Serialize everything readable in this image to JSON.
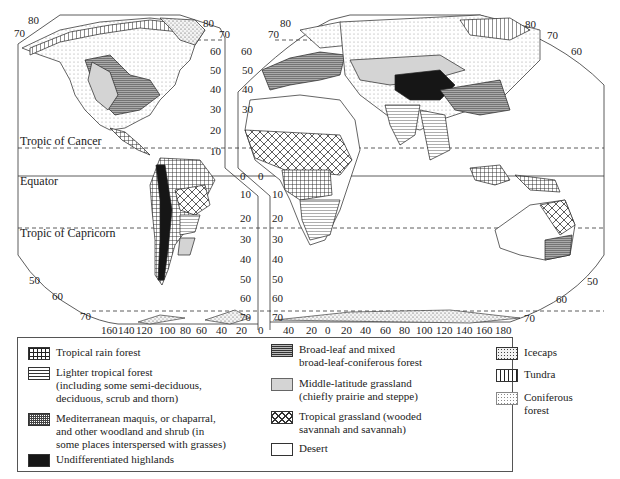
{
  "figure": {
    "type": "world vegetation map",
    "parallels": {
      "tropic_of_cancer": "Tropic of Cancer",
      "equator": "Equator",
      "tropic_of_capricorn": "Tropic of Capricorn"
    },
    "latitude_labels_left_panel_top": [
      "80",
      "70"
    ],
    "latitude_labels_left_panel_right_edge": [
      "80",
      "70",
      "60",
      "50",
      "40",
      "30",
      "20",
      "10",
      "0",
      "10",
      "20",
      "30",
      "40",
      "50",
      "60",
      "70"
    ],
    "latitude_labels_right_panel_left_edge": [
      "80",
      "70",
      "60",
      "50",
      "40",
      "30",
      "0",
      "10",
      "20",
      "30",
      "40",
      "50",
      "60",
      "70"
    ],
    "latitude_labels_left_bottom": [
      "50",
      "60",
      "70"
    ],
    "latitude_labels_right_top": [
      "80",
      "70",
      "60"
    ],
    "latitude_labels_right_bottom": [
      "50",
      "60",
      "70"
    ],
    "longitude_labels_west": [
      "160",
      "140",
      "120",
      "100",
      "80",
      "60",
      "40",
      "20",
      "0"
    ],
    "longitude_labels_east": [
      "40",
      "20",
      "0",
      "20",
      "40",
      "60",
      "80",
      "100",
      "120",
      "140",
      "160",
      "180"
    ]
  },
  "legend": {
    "items": [
      {
        "key": "tropical-rain-forest",
        "lines": [
          "Tropical rain forest"
        ]
      },
      {
        "key": "lighter-tropical-forest",
        "lines": [
          "Lighter tropical forest",
          "(including some semi-deciduous,",
          "deciduous, scrub and thorn)"
        ]
      },
      {
        "key": "mediterranean",
        "lines": [
          "Mediterranean maquis, or chaparral,",
          "and other woodland and shrub (in",
          "some places interspersed with grasses)"
        ]
      },
      {
        "key": "undifferentiated-highlands",
        "lines": [
          "Undifferentiated highlands"
        ]
      },
      {
        "key": "broad-leaf",
        "lines": [
          "Broad-leaf and mixed",
          "broad-leaf-coniferous forest"
        ]
      },
      {
        "key": "middle-latitude-grassland",
        "lines": [
          "Middle-latitude grassland",
          "(chiefly prairie and steppe)"
        ]
      },
      {
        "key": "tropical-grassland",
        "lines": [
          "Tropical grassland (wooded",
          "savannah and savannah)"
        ]
      },
      {
        "key": "desert",
        "lines": [
          "Desert"
        ]
      },
      {
        "key": "icecaps",
        "lines": [
          "Icecaps"
        ]
      },
      {
        "key": "tundra",
        "lines": [
          "Tundra"
        ]
      },
      {
        "key": "coniferous-forest",
        "lines": [
          "Coniferous forest"
        ]
      }
    ]
  }
}
